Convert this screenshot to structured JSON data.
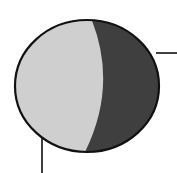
{
  "diagram": {
    "background": "#ffffff",
    "circle": {
      "cx": 87,
      "cy": 86,
      "rx": 72,
      "ry": 66,
      "stroke": "#111111",
      "stroke_width": 2.2
    },
    "lit_region": {
      "fill": "#cfcfcf"
    },
    "shadow_region": {
      "fill": "#3f3f3f"
    },
    "terminator": {
      "top_x": 91,
      "mid_x": 103,
      "bottom_x": 84
    },
    "leader_lines": [
      {
        "name": "right-leader",
        "x1": 156,
        "y1": 53,
        "x2": 177,
        "y2": 53
      },
      {
        "name": "bottom-leader",
        "x1": 42,
        "y1": 138,
        "x2": 42,
        "y2": 173
      }
    ],
    "line_color": "#111111"
  }
}
